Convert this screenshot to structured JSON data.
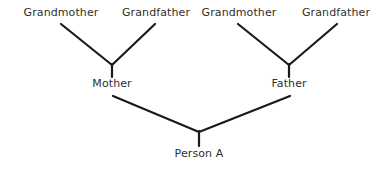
{
  "diagram": {
    "type": "family-tree",
    "background_color": "#ffffff",
    "line_color": "#1a1a1a",
    "text_color": "#2f2f2f",
    "line_width": 2,
    "width": 390,
    "height": 171,
    "generations": [
      {
        "name": "grandparents",
        "nodes": [
          {
            "id": "maternal-grandmother",
            "label": "Grandmother",
            "x": 61,
            "y": 13
          },
          {
            "id": "maternal-grandfather",
            "label": "Grandfather",
            "x": 156,
            "y": 13
          },
          {
            "id": "paternal-grandmother",
            "label": "Grandmother",
            "x": 239,
            "y": 13
          },
          {
            "id": "paternal-grandfather",
            "label": "Grandfather",
            "x": 336,
            "y": 13
          }
        ]
      },
      {
        "name": "parents",
        "nodes": [
          {
            "id": "mother",
            "label": "Mother",
            "x": 112,
            "y": 84
          },
          {
            "id": "father",
            "label": "Father",
            "x": 289,
            "y": 84
          }
        ]
      },
      {
        "name": "child",
        "nodes": [
          {
            "id": "person-a",
            "label": "Person A",
            "x": 199,
            "y": 154
          }
        ]
      }
    ],
    "connectors": [
      {
        "id": "maternal-join",
        "from": [
          "maternal-grandmother",
          "maternal-grandfather"
        ],
        "to": "mother",
        "left_arm": {
          "x1": 61,
          "y1": 24,
          "x2": 112,
          "y2": 65
        },
        "right_arm": {
          "x1": 112,
          "y1": 65,
          "x2": 155,
          "y2": 24
        },
        "stem": {
          "x1": 112,
          "y1": 65,
          "x2": 112,
          "y2": 77
        }
      },
      {
        "id": "paternal-join",
        "from": [
          "paternal-grandmother",
          "paternal-grandfather"
        ],
        "to": "father",
        "left_arm": {
          "x1": 238,
          "y1": 24,
          "x2": 289,
          "y2": 65
        },
        "right_arm": {
          "x1": 289,
          "y1": 65,
          "x2": 337,
          "y2": 24
        },
        "stem": {
          "x1": 289,
          "y1": 65,
          "x2": 289,
          "y2": 77
        }
      },
      {
        "id": "parents-join",
        "from": [
          "mother",
          "father"
        ],
        "to": "person-a",
        "left_arm": {
          "x1": 113,
          "y1": 96,
          "x2": 199,
          "y2": 132
        },
        "right_arm": {
          "x1": 199,
          "y1": 132,
          "x2": 290,
          "y2": 96
        },
        "stem": {
          "x1": 199,
          "y1": 132,
          "x2": 199,
          "y2": 146
        }
      }
    ]
  }
}
